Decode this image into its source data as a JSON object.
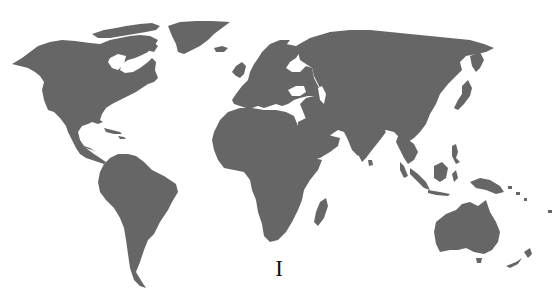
{
  "map": {
    "type": "world-map",
    "style": "grayscale silhouette",
    "colors": {
      "land": "#666666",
      "water": "#ffffff",
      "label": "#111111"
    },
    "regions": [
      "North America",
      "Greenland",
      "South America",
      "Europe",
      "Africa",
      "Madagascar",
      "Asia",
      "Arabian Peninsula",
      "India",
      "Southeast Asia",
      "Indonesia",
      "Japan",
      "New Guinea",
      "Australia",
      "New Zealand"
    ]
  },
  "caption": {
    "label": "I"
  }
}
